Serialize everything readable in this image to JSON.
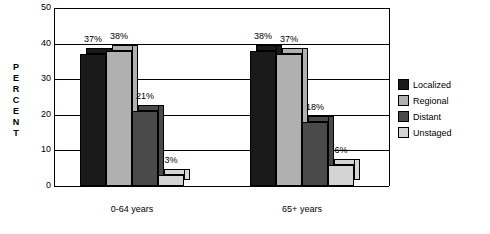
{
  "chart_data": {
    "type": "bar",
    "title": "",
    "xlabel": "",
    "ylabel": "PERCENT",
    "ylim": [
      0,
      50
    ],
    "yticks": [
      0,
      10,
      20,
      30,
      40,
      50
    ],
    "grid": true,
    "legend_position": "right",
    "categories": [
      "0-64 years",
      "65+ years"
    ],
    "series": [
      {
        "name": "Localized",
        "values": [
          37,
          38
        ],
        "labels": [
          "37%",
          "38%"
        ],
        "color": "#1a1a1a"
      },
      {
        "name": "Regional",
        "values": [
          38,
          37
        ],
        "labels": [
          "38%",
          "37%"
        ],
        "color": "#b0b0b0"
      },
      {
        "name": "Distant",
        "values": [
          21,
          18
        ],
        "labels": [
          "21%",
          "18%"
        ],
        "color": "#4a4a4a"
      },
      {
        "name": "Unstaged",
        "values": [
          3,
          6
        ],
        "labels": [
          "3%",
          "6%"
        ],
        "color": "#d4d4d4"
      }
    ]
  },
  "axis": {
    "y_label_letters": [
      "P",
      "E",
      "R",
      "C",
      "E",
      "N",
      "T"
    ],
    "y_tick_labels": [
      "50",
      "40",
      "30",
      "20",
      "10",
      "0"
    ]
  },
  "legend": {
    "items": [
      {
        "label": "Localized"
      },
      {
        "label": "Regional"
      },
      {
        "label": "Distant"
      },
      {
        "label": "Unstaged"
      }
    ]
  }
}
